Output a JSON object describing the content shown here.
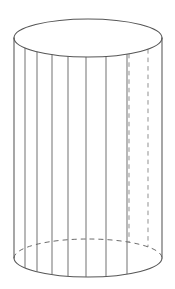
{
  "figure": {
    "title": "Cylinder with vertical ruling lines",
    "type": "geometric-solid",
    "solid_name": "cylinder",
    "background_color": "#ffffff",
    "stroke_color": "#565656",
    "hidden_stroke_color": "#8a8a8a",
    "canvas": {
      "width": 175,
      "height": 289
    },
    "geometry": {
      "center_x": 88,
      "radius_x": 74,
      "radius_y": 19,
      "top_ellipse_center_y": 38,
      "bottom_ellipse_center_y": 258,
      "height": 220
    },
    "parts": {
      "top_ellipse": {
        "label": "top circular face",
        "front_arc_style": "solid",
        "back_arc_style": "solid"
      },
      "bottom_ellipse": {
        "label": "bottom circular face",
        "front_arc_style": "solid",
        "back_arc_style": "dashed"
      },
      "left_silhouette": {
        "label": "left side edge",
        "style": "solid",
        "x": 14
      },
      "right_silhouette": {
        "label": "right side edge",
        "style": "solid",
        "x": 162
      }
    },
    "ruling_lines": {
      "label": "vertical ruling lines on lateral surface",
      "visible": [
        {
          "x": 25,
          "style": "solid"
        },
        {
          "x": 37,
          "style": "solid"
        },
        {
          "x": 52,
          "style": "solid"
        },
        {
          "x": 68,
          "style": "solid"
        },
        {
          "x": 86,
          "style": "solid"
        },
        {
          "x": 106,
          "style": "solid"
        },
        {
          "x": 127,
          "style": "solid"
        }
      ],
      "hidden": [
        {
          "x": 129,
          "style": "dashed"
        },
        {
          "x": 148,
          "style": "dashed"
        }
      ]
    }
  }
}
